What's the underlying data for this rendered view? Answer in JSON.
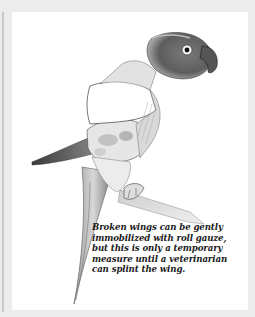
{
  "figure": {
    "style": "pencil illustration, grayscale",
    "colors": {
      "frame": "#ececec",
      "panel": "#ffffff",
      "ink": "#1a1a1a"
    }
  },
  "caption": {
    "lines": [
      "Broken wings can be gently",
      "immobilized with roll gauze,",
      "but this is only a temporary",
      "measure until a veterinarian",
      "can splint the wing."
    ]
  }
}
